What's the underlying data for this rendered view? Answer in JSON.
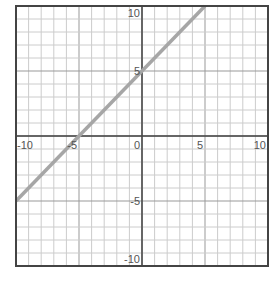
{
  "chart_data": {
    "type": "line",
    "title": "",
    "xlabel": "",
    "ylabel": "",
    "xlim": [
      -10,
      10
    ],
    "ylim": [
      -10,
      10
    ],
    "grid": true,
    "minor_step": 1,
    "major_step": 5,
    "x_tick_labels": [
      "-10",
      "-5",
      "0",
      "5",
      "10"
    ],
    "y_tick_labels": [
      "10",
      "5",
      "-5",
      "-10"
    ],
    "series": [
      {
        "name": "y = x + 5",
        "x": [
          -10,
          5
        ],
        "y": [
          -5,
          10
        ],
        "color": "#a6a6a6"
      }
    ]
  },
  "colors": {
    "frame": "#444444",
    "axis": "#444444",
    "grid": "#cccccc",
    "line": "#a6a6a6",
    "label": "#555555"
  }
}
